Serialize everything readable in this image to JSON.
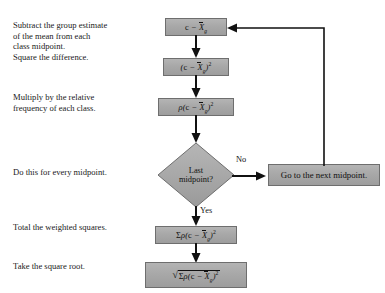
{
  "diagram": {
    "type": "flowchart",
    "background_color": "#ffffff",
    "node_fill_color": "#a8a8a8",
    "node_border_color": "#6e6e6e",
    "connector_color": "#111111",
    "steps": [
      {
        "id": "step-subtract",
        "description": "Subtract the group estimate\nof the mean from each\nclass midpoint.",
        "formula_plain": "c - X̄g"
      },
      {
        "id": "step-square",
        "description": "Square the difference.",
        "formula_plain": "(c - X̄g)²"
      },
      {
        "id": "step-multiply",
        "description": "Multiply by the relative\nfrequency of each class.",
        "formula_plain": "ρ(c - X̄g)²"
      },
      {
        "id": "step-decision",
        "description": "Do this for every midpoint.",
        "formula_plain": "Last midpoint?"
      },
      {
        "id": "step-total",
        "description": "Total the weighted squares.",
        "formula_plain": "Σρ(c - X̄g)²"
      },
      {
        "id": "step-root",
        "description": "Take the square root.",
        "formula_plain": "√(Σρ(c - X̄g)²)"
      }
    ],
    "decision": {
      "line1": "Last",
      "line2": "midpoint?",
      "branch_no": "No",
      "branch_yes": "Yes"
    },
    "loop_node": {
      "label": "Go to the next midpoint."
    }
  }
}
